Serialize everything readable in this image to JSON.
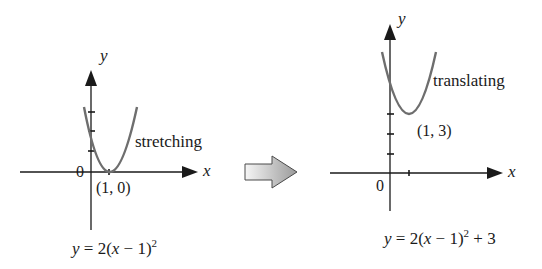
{
  "left_graph": {
    "y_label": "y",
    "x_label": "x",
    "origin_label": "0",
    "vertex_label": "(1, 0)",
    "transform_label": "stretching",
    "equation": {
      "lhs": "y",
      "eq": " = ",
      "coef": "2(",
      "var": "x",
      "rest": " − 1)",
      "exp": "2",
      "tail": ""
    }
  },
  "arrow": {
    "direction": "right",
    "meaning": "transformation step"
  },
  "right_graph": {
    "y_label": "y",
    "x_label": "x",
    "origin_label": "0",
    "vertex_label": "(1, 3)",
    "transform_label": "translating",
    "equation": {
      "lhs": "y",
      "eq": " = ",
      "coef": "2(",
      "var": "x",
      "rest": " − 1)",
      "exp": "2",
      "tail": " + 3"
    }
  },
  "colors": {
    "axis": "#1a1a1a",
    "curve": "#6e6e6e",
    "arrow_fill_start": "#f4f4f4",
    "arrow_fill_end": "#9a9a9a",
    "arrow_stroke": "#4a4a4a"
  }
}
